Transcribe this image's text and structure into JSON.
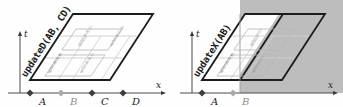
{
  "figure": {
    "background": "#fefefe",
    "ink": "#1c1c1c",
    "shade_color": "#b8b8b8",
    "faint_color": "#c9c9c9"
  },
  "panels": [
    {
      "id": "left",
      "name": "updateD-panel",
      "main_label": "updateD(AB, CD)",
      "axes": {
        "t": "t",
        "x": "x"
      },
      "points": [
        {
          "label": "A",
          "dim": false
        },
        {
          "label": "B",
          "dim": true
        },
        {
          "label": "C",
          "dim": false
        },
        {
          "label": "D",
          "dim": false
        }
      ],
      "cells": [
        {
          "label": "updateD(A,B)",
          "row": "bottom",
          "col": 0
        },
        {
          "label": "updateD(B,C)",
          "row": "bottom",
          "col": 1
        },
        {
          "label": "updateD(B,C)",
          "row": "top",
          "col": 0
        },
        {
          "label": "updateD(C,D)",
          "row": "top",
          "col": 1
        }
      ],
      "shaded": false
    },
    {
      "id": "right",
      "name": "updateX-panel",
      "main_label": "updateX(AB)",
      "axes": {
        "t": "t",
        "x": "x"
      },
      "points": [
        {
          "label": "A",
          "dim": false
        },
        {
          "label": "B",
          "dim": true
        }
      ],
      "cells": [
        {
          "label": "updateD(A,B)",
          "row": "bottom",
          "col": 0
        },
        {
          "label": "updateX(C)",
          "row": "bottom",
          "col": 1
        },
        {
          "label": "updateX(C)",
          "row": "top",
          "col": 0
        }
      ],
      "shaded": true
    }
  ]
}
